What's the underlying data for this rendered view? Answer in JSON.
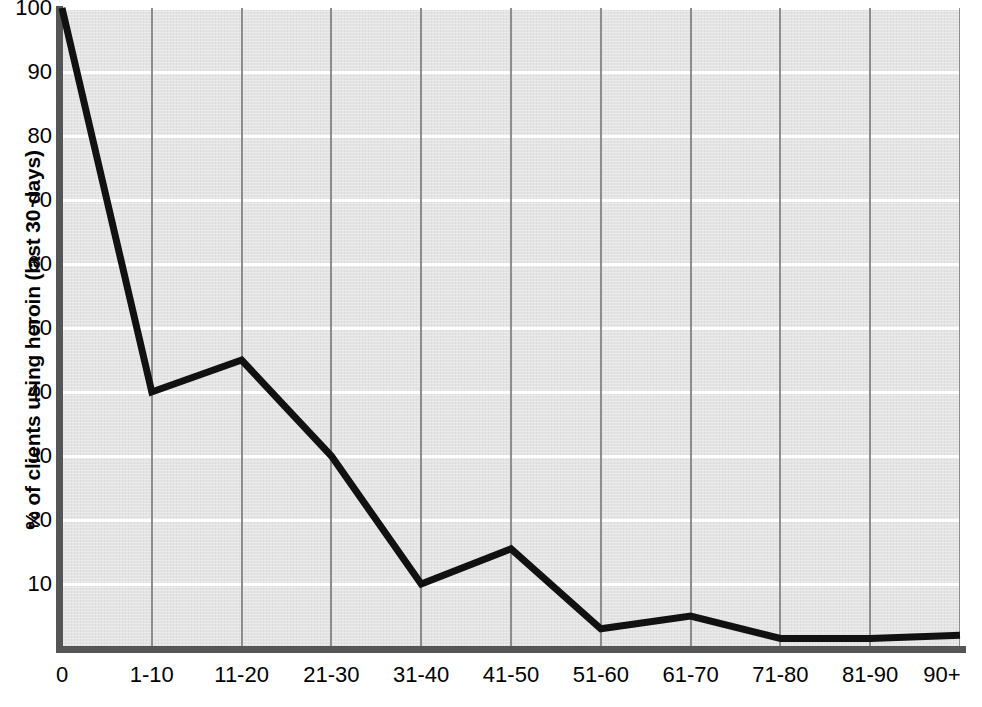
{
  "chart_data": {
    "type": "line",
    "title": "",
    "xlabel": "",
    "ylabel": "% of clients using heroin (last 30 days)",
    "categories": [
      "0",
      "1-10",
      "11-20",
      "21-30",
      "31-40",
      "41-50",
      "51-60",
      "61-70",
      "71-80",
      "81-90",
      "90+"
    ],
    "values": [
      100,
      40,
      45,
      30,
      10,
      15.5,
      3,
      5,
      1.5,
      1.5,
      2
    ],
    "series": [
      {
        "name": "% of clients using heroin (last 30 days)",
        "values": [
          100,
          40,
          45,
          30,
          10,
          15.5,
          3,
          5,
          1.5,
          1.5,
          2
        ]
      }
    ],
    "ylim": [
      0,
      100
    ],
    "y_ticks": [
      10,
      20,
      30,
      40,
      50,
      60,
      70,
      80,
      90,
      100
    ],
    "y_tick_labels": [
      "10",
      "20",
      "30",
      "40",
      "50",
      "60",
      "70",
      "80",
      "90",
      "100"
    ],
    "grid": true,
    "grid_horizontal": true,
    "grid_vertical": true,
    "legend": "none",
    "line_color": "#111111",
    "line_width": 7,
    "plot_background": "#e4e4e4",
    "hgrid_color": "#ffffff",
    "vgrid_color": "#8d8d8d",
    "axis_color": "#555555"
  },
  "axes": {
    "y_title": "% of clients using heroin (last 30 days)"
  }
}
